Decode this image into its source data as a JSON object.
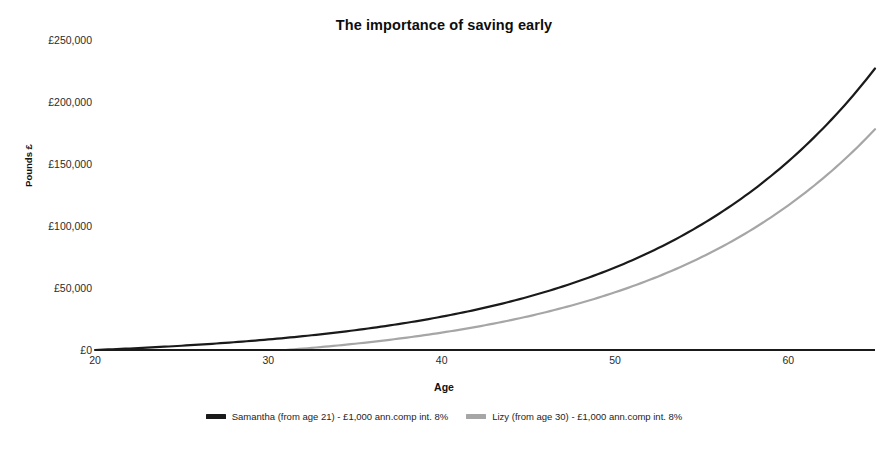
{
  "chart_data": {
    "type": "line",
    "title": "The importance of saving early",
    "xlabel": "Age",
    "ylabel": "Pounds £",
    "xlim": [
      20,
      65
    ],
    "ylim": [
      0,
      250000
    ],
    "grid": false,
    "legend_position": "bottom",
    "x_ticks": [
      {
        "value": 20,
        "label": "20"
      },
      {
        "value": 30,
        "label": "30"
      },
      {
        "value": 40,
        "label": "40"
      },
      {
        "value": 50,
        "label": "50"
      },
      {
        "value": 60,
        "label": "60"
      }
    ],
    "y_ticks": [
      {
        "value": 0,
        "label": "£0"
      },
      {
        "value": 50000,
        "label": "£50,000"
      },
      {
        "value": 100000,
        "label": "£100,000"
      },
      {
        "value": 150000,
        "label": "£150,000"
      },
      {
        "value": 200000,
        "label": "£200,000"
      },
      {
        "value": 250000,
        "label": "£250,000"
      }
    ],
    "x": [
      20,
      21,
      22,
      23,
      24,
      25,
      26,
      27,
      28,
      29,
      30,
      31,
      32,
      33,
      34,
      35,
      36,
      37,
      38,
      39,
      40,
      41,
      42,
      43,
      44,
      45,
      46,
      47,
      48,
      49,
      50,
      51,
      52,
      53,
      54,
      55,
      56,
      57,
      58,
      59,
      60,
      61,
      62,
      63,
      64,
      65
    ],
    "series": [
      {
        "name": "Samantha (from age 21) - £1,000 ann.comp int. 8%",
        "color": "#1a1a1a",
        "start_age": 21,
        "values": [
          0,
          0,
          1080,
          2246,
          3506,
          4867,
          6336,
          7923,
          9637,
          11488,
          13487,
          15645,
          17977,
          20495,
          23215,
          26152,
          29324,
          32750,
          36450,
          40446,
          44762,
          49423,
          54457,
          59894,
          65765,
          72106,
          78954,
          86351,
          94338,
          102965,
          112283,
          122346,
          133214,
          144951,
          157627,
          171317,
          186102,
          202071,
          219316,
          237941,
          258056,
          279781,
          303243,
          328583,
          355949,
          385505
        ]
      },
      {
        "name": "Lizy (from age 30) - £1,000 ann.comp int. 8%",
        "color": "#a6a6a6",
        "start_age": 30,
        "values": [
          0,
          0,
          0,
          0,
          0,
          0,
          0,
          0,
          0,
          0,
          0,
          1080,
          2246,
          3506,
          4867,
          6336,
          7923,
          9637,
          11488,
          13487,
          15645,
          17977,
          20495,
          23215,
          26152,
          29324,
          32750,
          36450,
          40446,
          44762,
          49423,
          54457,
          59894,
          65765,
          72106,
          78954,
          86351,
          94338,
          102965,
          112283,
          122346,
          133214,
          144951,
          157627,
          171317,
          186102
        ]
      }
    ],
    "rendered_series": [
      {
        "name": "Samantha (from age 21) - £1,000 ann.comp int. 8%",
        "color": "#1a1a1a",
        "width": 2.2,
        "points": [
          [
            20,
            0
          ],
          [
            22,
            1500
          ],
          [
            24,
            3800
          ],
          [
            26,
            6600
          ],
          [
            28,
            10000
          ],
          [
            30,
            14000
          ],
          [
            32,
            18700
          ],
          [
            34,
            24100
          ],
          [
            36,
            30400
          ],
          [
            38,
            37800
          ],
          [
            40,
            32000
          ],
          [
            40,
            46400
          ],
          [
            42,
            56300
          ],
          [
            44,
            67900
          ],
          [
            46,
            81500
          ],
          [
            48,
            97300
          ],
          [
            50,
            115700
          ],
          [
            52,
            137000
          ],
          [
            54,
            161800
          ],
          [
            56,
            190500
          ],
          [
            58,
            200000
          ],
          [
            60,
            218000
          ],
          [
            62,
            243000
          ],
          [
            64,
            249000
          ],
          [
            65,
            227000
          ]
        ],
        "endpoint_value": 227000
      },
      {
        "name": "Lizy (from age 30) - £1,000 ann.comp int. 8%",
        "color": "#a6a6a6",
        "width": 2.2,
        "points": [
          [
            31,
            0
          ],
          [
            33,
            2200
          ],
          [
            35,
            5000
          ],
          [
            37,
            8600
          ],
          [
            39,
            13000
          ],
          [
            41,
            18400
          ],
          [
            43,
            24700
          ],
          [
            45,
            32100
          ],
          [
            47,
            40800
          ],
          [
            49,
            51000
          ],
          [
            51,
            62900
          ],
          [
            53,
            76900
          ],
          [
            55,
            93200
          ],
          [
            57,
            112200
          ],
          [
            59,
            134500
          ],
          [
            61,
            150000
          ],
          [
            63,
            163000
          ],
          [
            65,
            178000
          ]
        ],
        "endpoint_value": 178000
      }
    ]
  },
  "legend": {
    "entries": [
      {
        "label": "Samantha (from age 21) - £1,000 ann.comp int. 8%",
        "color": "#1a1a1a"
      },
      {
        "label": "Lizy (from age 30) - £1,000 ann.comp int. 8%",
        "color": "#a6a6a6"
      }
    ]
  }
}
